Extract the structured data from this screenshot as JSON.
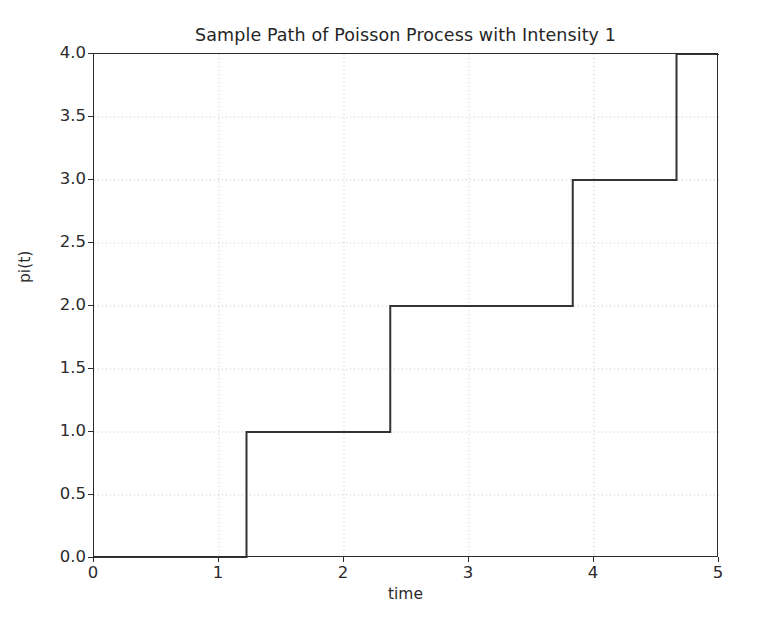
{
  "chart_data": {
    "type": "line",
    "step": "post",
    "title": "Sample Path of Poisson Process with Intensity 1",
    "xlabel": "time",
    "ylabel": "pi(t)",
    "xlim": [
      0,
      5
    ],
    "ylim": [
      0,
      4
    ],
    "grid": true,
    "grid_style": "dotted",
    "legend": null,
    "xticks": [
      0,
      1,
      2,
      3,
      4,
      5
    ],
    "xtick_labels": [
      "0",
      "1",
      "2",
      "3",
      "4",
      "5"
    ],
    "yticks": [
      0.0,
      0.5,
      1.0,
      1.5,
      2.0,
      2.5,
      3.0,
      3.5,
      4.0
    ],
    "ytick_labels": [
      "0.0",
      "0.5",
      "1.0",
      "1.5",
      "2.0",
      "2.5",
      "3.0",
      "3.5",
      "4.0"
    ],
    "jump_times": [
      1.22,
      2.37,
      3.83,
      4.66
    ],
    "series": [
      {
        "name": "pi(t)",
        "color": "#333333",
        "linewidth": 2,
        "x": [
          0,
          1.22,
          1.22,
          2.37,
          2.37,
          3.83,
          3.83,
          4.66,
          4.66,
          5
        ],
        "y": [
          0,
          0,
          1,
          1,
          2,
          2,
          3,
          3,
          4,
          4
        ]
      }
    ]
  },
  "colors": {
    "line": "#333333",
    "frame": "#2b2b2b",
    "grid": "#c8c8c8",
    "text": "#2b2b2b",
    "background": "#ffffff"
  }
}
